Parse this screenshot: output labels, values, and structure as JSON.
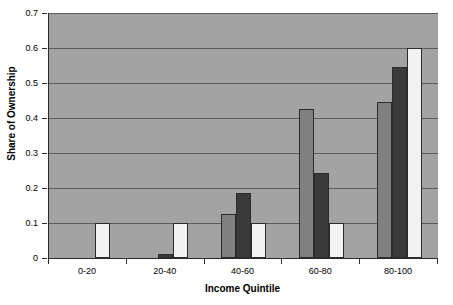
{
  "chart_data": {
    "type": "bar",
    "title": "",
    "xlabel": "Income Quintile",
    "ylabel": "Share of Ownership",
    "categories": [
      "0-20",
      "20-40",
      "40-60",
      "60-80",
      "80-100"
    ],
    "ylim": [
      0,
      0.7
    ],
    "ytick_labels": [
      "0",
      "0.1",
      "0.2",
      "0.3",
      "0.4",
      "0.5",
      "0.6",
      "0.7"
    ],
    "ytick_values": [
      0,
      0.1,
      0.2,
      0.3,
      0.4,
      0.5,
      0.6,
      0.7
    ],
    "grid": true,
    "legend": "none",
    "plot_background": "#a3a3a3",
    "series": [
      {
        "name": "series-1",
        "color": "#808080",
        "values": [
          0,
          0,
          0.125,
          0.425,
          0.445
        ]
      },
      {
        "name": "series-2",
        "color": "#3a3a3a",
        "values": [
          0,
          0.012,
          0.185,
          0.243,
          0.545
        ]
      },
      {
        "name": "series-3",
        "color": "#f2f2f2",
        "values": [
          0.1,
          0.1,
          0.1,
          0.1,
          0.6
        ]
      }
    ]
  }
}
